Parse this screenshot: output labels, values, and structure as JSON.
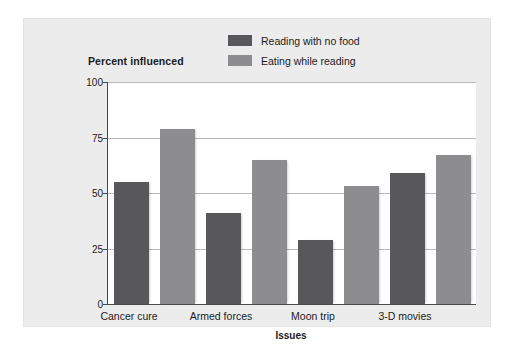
{
  "chart_data": {
    "type": "bar",
    "title": "",
    "ylabel": "Percent influenced",
    "xlabel": "Issues",
    "categories": [
      "Cancer cure",
      "Armed forces",
      "Moon trip",
      "3-D movies"
    ],
    "series": [
      {
        "name": "Reading with no food",
        "color": "#58585a",
        "values": [
          55,
          41,
          29,
          59
        ]
      },
      {
        "name": "Eating while reading",
        "color": "#8d8d8f",
        "values": [
          79,
          65,
          53,
          67
        ]
      }
    ],
    "ylim": [
      0,
      100
    ],
    "yticks": [
      0,
      25,
      50,
      75,
      100
    ],
    "ytick_labels": [
      "0",
      "25",
      "50",
      "75",
      "100"
    ],
    "grid": true,
    "legend_position": "top-right"
  },
  "legend": {
    "items": [
      {
        "label": "Reading with no food",
        "swatch": "dark"
      },
      {
        "label": "Eating while reading",
        "swatch": "light"
      }
    ]
  },
  "axes": {
    "y_title": "Percent influenced",
    "x_title": "Issues",
    "y_ticks": [
      "100",
      "75",
      "50",
      "25",
      "0"
    ],
    "x_ticks": [
      "Cancer cure",
      "Armed forces",
      "Moon trip",
      "3-D movies"
    ]
  }
}
